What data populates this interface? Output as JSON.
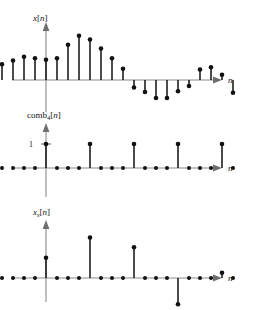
{
  "figure": {
    "title": "",
    "axis_label_n": "n",
    "plots": [
      {
        "id": "plot-x",
        "label_main": "x",
        "label_sub": "",
        "label_bracket": "[n]",
        "label_text": "x[n]",
        "axis_label": "n",
        "y_tick_label": "",
        "baseline_y": 80,
        "origin_x": 46,
        "step": 11.0,
        "unit_height": 15,
        "samples": [
          {
            "n": -4,
            "v": 1.05
          },
          {
            "n": -3,
            "v": 1.3
          },
          {
            "n": -2,
            "v": 1.55
          },
          {
            "n": -1,
            "v": 1.45
          },
          {
            "n": 0,
            "v": 1.35
          },
          {
            "n": 1,
            "v": 1.45
          },
          {
            "n": 2,
            "v": 2.35
          },
          {
            "n": 3,
            "v": 2.95
          },
          {
            "n": 4,
            "v": 2.7
          },
          {
            "n": 5,
            "v": 2.1
          },
          {
            "n": 6,
            "v": 1.45
          },
          {
            "n": 7,
            "v": 0.75
          },
          {
            "n": 8,
            "v": -0.5
          },
          {
            "n": 9,
            "v": -0.8
          },
          {
            "n": 10,
            "v": -1.2
          },
          {
            "n": 11,
            "v": -1.2
          },
          {
            "n": 12,
            "v": -0.75
          },
          {
            "n": 13,
            "v": -0.4
          },
          {
            "n": 14,
            "v": 0.7
          },
          {
            "n": 15,
            "v": 0.85
          },
          {
            "n": 16,
            "v": 0.35
          },
          {
            "n": 17,
            "v": -0.85
          }
        ]
      },
      {
        "id": "plot-comb",
        "label_main": "comb",
        "label_sub": "4",
        "label_bracket": "[n]",
        "label_text": "comb4[n]",
        "axis_label": "n",
        "y_tick_label": "1",
        "baseline_y": 168,
        "origin_x": 46,
        "step": 11.0,
        "unit_height": 24,
        "period": 4,
        "samples": [
          {
            "n": -4,
            "v": 0
          },
          {
            "n": -3,
            "v": 0
          },
          {
            "n": -2,
            "v": 0
          },
          {
            "n": -1,
            "v": 0
          },
          {
            "n": 0,
            "v": 1
          },
          {
            "n": 1,
            "v": 0
          },
          {
            "n": 2,
            "v": 0
          },
          {
            "n": 3,
            "v": 0
          },
          {
            "n": 4,
            "v": 1
          },
          {
            "n": 5,
            "v": 0
          },
          {
            "n": 6,
            "v": 0
          },
          {
            "n": 7,
            "v": 0
          },
          {
            "n": 8,
            "v": 1
          },
          {
            "n": 9,
            "v": 0
          },
          {
            "n": 10,
            "v": 0
          },
          {
            "n": 11,
            "v": 0
          },
          {
            "n": 12,
            "v": 1
          },
          {
            "n": 13,
            "v": 0
          },
          {
            "n": 14,
            "v": 0
          },
          {
            "n": 15,
            "v": 0
          },
          {
            "n": 16,
            "v": 1
          },
          {
            "n": 17,
            "v": 0
          }
        ]
      },
      {
        "id": "plot-xs",
        "label_main": "x",
        "label_sub": "s",
        "label_bracket": "[n]",
        "label_text": "xs[n]",
        "axis_label": "n",
        "y_tick_label": "",
        "baseline_y": 278,
        "origin_x": 46,
        "step": 11.0,
        "unit_height": 15,
        "samples": [
          {
            "n": -4,
            "v": 0
          },
          {
            "n": -3,
            "v": 0
          },
          {
            "n": -2,
            "v": 0
          },
          {
            "n": -1,
            "v": 0
          },
          {
            "n": 0,
            "v": 1.35
          },
          {
            "n": 1,
            "v": 0
          },
          {
            "n": 2,
            "v": 0
          },
          {
            "n": 3,
            "v": 0
          },
          {
            "n": 4,
            "v": 2.7
          },
          {
            "n": 5,
            "v": 0
          },
          {
            "n": 6,
            "v": 0
          },
          {
            "n": 7,
            "v": 0
          },
          {
            "n": 8,
            "v": 2.05
          },
          {
            "n": 9,
            "v": 0
          },
          {
            "n": 10,
            "v": 0
          },
          {
            "n": 11,
            "v": 0
          },
          {
            "n": 12,
            "v": -1.75
          },
          {
            "n": 13,
            "v": 0
          },
          {
            "n": 14,
            "v": 0
          },
          {
            "n": 15,
            "v": 0
          },
          {
            "n": 16,
            "v": 0.35
          },
          {
            "n": 17,
            "v": 0
          }
        ]
      }
    ]
  },
  "chart_data": {
    "type": "scatter",
    "xlabel": "n",
    "ylabel": "",
    "grid": false,
    "legend": "none",
    "subplots": [
      {
        "name": "x[n]",
        "type": "stem",
        "x": [
          -4,
          -3,
          -2,
          -1,
          0,
          1,
          2,
          3,
          4,
          5,
          6,
          7,
          8,
          9,
          10,
          11,
          12,
          13,
          14,
          15,
          16,
          17
        ],
        "y": [
          1.05,
          1.3,
          1.55,
          1.45,
          1.35,
          1.45,
          2.35,
          2.95,
          2.7,
          2.1,
          1.45,
          0.75,
          -0.5,
          -0.8,
          -1.2,
          -1.2,
          -0.75,
          -0.4,
          0.7,
          0.85,
          0.35,
          -0.85
        ],
        "ylim": [
          -1.6,
          3.3
        ],
        "ytick_labels": []
      },
      {
        "name": "comb4[n]",
        "type": "stem",
        "x": [
          -4,
          -3,
          -2,
          -1,
          0,
          1,
          2,
          3,
          4,
          5,
          6,
          7,
          8,
          9,
          10,
          11,
          12,
          13,
          14,
          15,
          16,
          17
        ],
        "y": [
          0,
          0,
          0,
          0,
          1,
          0,
          0,
          0,
          1,
          0,
          0,
          0,
          1,
          0,
          0,
          0,
          1,
          0,
          0,
          0,
          1,
          0
        ],
        "ylim": [
          0,
          1.6
        ],
        "ytick_labels": [
          "1"
        ]
      },
      {
        "name": "xs[n]",
        "type": "stem",
        "x": [
          -4,
          -3,
          -2,
          -1,
          0,
          1,
          2,
          3,
          4,
          5,
          6,
          7,
          8,
          9,
          10,
          11,
          12,
          13,
          14,
          15,
          16,
          17
        ],
        "y": [
          0,
          0,
          0,
          0,
          1.35,
          0,
          0,
          0,
          2.7,
          0,
          0,
          0,
          2.05,
          0,
          0,
          0,
          -1.75,
          0,
          0,
          0,
          0.35,
          0
        ],
        "ylim": [
          -2.2,
          3.1
        ],
        "ytick_labels": []
      }
    ]
  },
  "colors": {
    "stem": "#111111",
    "axis": "#8a8a8a",
    "background": "#ffffff"
  }
}
